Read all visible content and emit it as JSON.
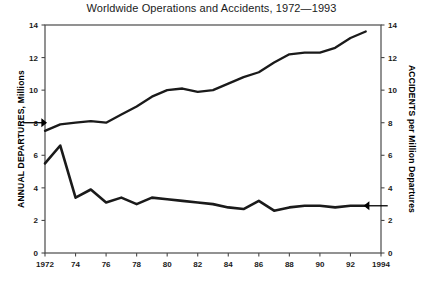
{
  "chart_data": {
    "type": "line",
    "title": "Worldwide Operations and Accidents, 1972—1993",
    "xlabel": "",
    "ylabel": "ANNUAL DEPARTURES, Millions",
    "y2label": "ACCIDENTS per Million Departures",
    "xlim": [
      1972,
      1994
    ],
    "ylim": [
      0,
      14
    ],
    "y2lim": [
      0,
      14
    ],
    "grid": false,
    "legend_position": "none",
    "xticks": [
      1972,
      1974,
      1976,
      1978,
      1980,
      1982,
      1984,
      1986,
      1988,
      1990,
      1992,
      1994
    ],
    "xticklabels": [
      "1972",
      "74",
      "76",
      "78",
      "80",
      "82",
      "84",
      "86",
      "88",
      "90",
      "92",
      "1994"
    ],
    "yticks": [
      0,
      2,
      4,
      6,
      8,
      10,
      12,
      14
    ],
    "yticklabels": [
      "0",
      "2",
      "4",
      "6",
      "8",
      "10",
      "12",
      "14"
    ],
    "y2ticks": [
      0,
      2,
      4,
      6,
      8,
      10,
      12,
      14
    ],
    "y2ticklabels": [
      "0",
      "2",
      "4",
      "6",
      "8",
      "10",
      "12",
      "14"
    ],
    "x": [
      1972,
      1973,
      1974,
      1975,
      1976,
      1977,
      1978,
      1979,
      1980,
      1981,
      1982,
      1983,
      1984,
      1985,
      1986,
      1987,
      1988,
      1989,
      1990,
      1991,
      1992,
      1993
    ],
    "series": [
      {
        "name": "Annual Departures",
        "axis": "left",
        "units": "Millions",
        "values": [
          7.5,
          7.9,
          8.0,
          8.1,
          8.0,
          8.5,
          9.0,
          9.6,
          10.0,
          10.1,
          9.9,
          10.0,
          10.4,
          10.8,
          11.1,
          11.7,
          12.2,
          12.3,
          12.3,
          12.6,
          13.2,
          13.6
        ]
      },
      {
        "name": "Accidents per Million Departures",
        "axis": "right",
        "units": "per Million Departures",
        "values": [
          5.5,
          6.6,
          3.4,
          3.9,
          3.1,
          3.4,
          3.0,
          3.4,
          3.3,
          3.2,
          3.1,
          3.0,
          2.8,
          2.7,
          3.2,
          2.6,
          2.8,
          2.9,
          2.9,
          2.8,
          2.9,
          2.9
        ]
      }
    ],
    "annotations": [
      {
        "name": "left-arrow-to-departures",
        "points_to_series": "Annual Departures",
        "direction": "right",
        "at_x": 1972,
        "at_y": 8.0
      },
      {
        "name": "right-arrow-to-accidents",
        "points_to_series": "Accidents per Million Departures",
        "direction": "left",
        "at_x": 1993,
        "at_y": 2.9
      }
    ]
  },
  "footer": {
    "partial_caption": ""
  }
}
